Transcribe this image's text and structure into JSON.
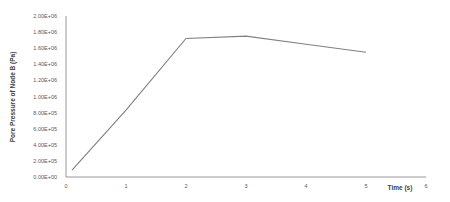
{
  "chart_data": {
    "type": "line",
    "title": "",
    "xlabel": "Time (s)",
    "ylabel": "Pore Pressure of Node B (Pa)",
    "xlim": [
      0,
      6
    ],
    "ylim": [
      0,
      2000000
    ],
    "x_ticks": [
      "0",
      "1",
      "2",
      "3",
      "4",
      "5",
      "6"
    ],
    "y_ticks": [
      "0.00E+00",
      "2.00E+05",
      "4.00E+05",
      "6.00E+05",
      "8.00E+05",
      "1.00E+06",
      "1.20E+06",
      "1.40E+06",
      "1.60E+06",
      "1.80E+06",
      "2.00E+06"
    ],
    "grid": false,
    "legend": "none",
    "series": [
      {
        "name": "Pore Pressure of Node B",
        "color": "#808080",
        "x": [
          0.1,
          1,
          2,
          3,
          4,
          5
        ],
        "values": [
          85000,
          830000,
          1720000,
          1750000,
          1650000,
          1550000
        ]
      }
    ]
  }
}
